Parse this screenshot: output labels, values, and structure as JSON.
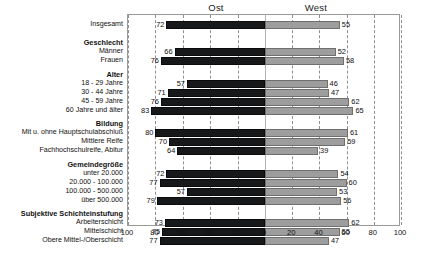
{
  "header": {
    "left_label": "Ost",
    "right_label": "West"
  },
  "axis": {
    "ticks": [
      "100",
      "80",
      "60",
      "40",
      "20",
      "0",
      "20",
      "40",
      "60",
      "80",
      "100"
    ],
    "max": 100,
    "step": 20
  },
  "colors": {
    "ost_bar": "#17181a",
    "west_bar": "#9d9d9d",
    "frame": "#9a9a9a",
    "grid": "#8f8f8f",
    "text": "#111111",
    "background": "#ffffff"
  },
  "chart_data": {
    "type": "bar",
    "title": "",
    "subtitle": "",
    "xlabel": "",
    "ylabel": "",
    "orientation": "horizontal-diverging",
    "xlim": [
      -100,
      100
    ],
    "grid": true,
    "legend_position": "top",
    "series": [
      {
        "name": "Ost",
        "side": "left",
        "color": "#17181a",
        "values": [
          72,
          66,
          76,
          57,
          71,
          76,
          83,
          80,
          70,
          64,
          72,
          77,
          57,
          79,
          73,
          75,
          77
        ]
      },
      {
        "name": "West",
        "side": "right",
        "color": "#9d9d9d",
        "values": [
          55,
          52,
          58,
          46,
          47,
          62,
          65,
          61,
          59,
          39,
          54,
          60,
          53,
          56,
          62,
          55,
          47
        ]
      }
    ],
    "categories": [
      "Insgesamt",
      "Männer",
      "Frauen",
      "18 - 29 Jahre",
      "30 - 44 Jahre",
      "45 - 59 Jahre",
      "60 Jahre und älter",
      "Mit u. ohne Hauptschulabschluß",
      "Mittlere Reife",
      "Fachhochschulreife, Abitur",
      "unter 20.000",
      "20.000 - 100.000",
      "100.000 - 500.000",
      "über 500.000",
      "Arbeiterschicht",
      "Mittelschicht",
      "Obere Mittel-/Oberschicht"
    ],
    "group_headers": [
      "Geschlecht",
      "Alter",
      "Bildung",
      "Gemeindegröße",
      "Subjektive Schichteinstufung"
    ],
    "rows": [
      {
        "kind": "group",
        "label": "",
        "ost": null,
        "west": null,
        "y": 0
      },
      {
        "kind": "data",
        "label": "Insgesamt",
        "ost": 72,
        "west": 55,
        "y": 6
      },
      {
        "kind": "group",
        "label": "Geschlecht",
        "ost": null,
        "west": null,
        "y": 25
      },
      {
        "kind": "data",
        "label": "Männer",
        "ost": 66,
        "west": 52,
        "y": 33
      },
      {
        "kind": "data",
        "label": "Frauen",
        "ost": 76,
        "west": 58,
        "y": 42
      },
      {
        "kind": "group",
        "label": "Alter",
        "ost": null,
        "west": null,
        "y": 57
      },
      {
        "kind": "data",
        "label": "18 - 29 Jahre",
        "ost": 57,
        "west": 46,
        "y": 65
      },
      {
        "kind": "data",
        "label": "30 - 44 Jahre",
        "ost": 71,
        "west": 47,
        "y": 74
      },
      {
        "kind": "data",
        "label": "45 - 59 Jahre",
        "ost": 76,
        "west": 62,
        "y": 83
      },
      {
        "kind": "data",
        "label": "60 Jahre und älter",
        "ost": 83,
        "west": 65,
        "y": 92
      },
      {
        "kind": "group",
        "label": "Bildung",
        "ost": null,
        "west": null,
        "y": 106
      },
      {
        "kind": "data",
        "label": "Mit u. ohne Hauptschulabschluß",
        "ost": 80,
        "west": 61,
        "y": 114
      },
      {
        "kind": "data",
        "label": "Mittlere Reife",
        "ost": 70,
        "west": 59,
        "y": 123
      },
      {
        "kind": "data",
        "label": "Fachhochschulreife, Abitur",
        "ost": 64,
        "west": 39,
        "y": 132
      },
      {
        "kind": "group",
        "label": "Gemeindegröße",
        "ost": null,
        "west": null,
        "y": 147
      },
      {
        "kind": "data",
        "label": "unter 20.000",
        "ost": 72,
        "west": 54,
        "y": 155
      },
      {
        "kind": "data",
        "label": "20.000 - 100.000",
        "ost": 77,
        "west": 60,
        "y": 164
      },
      {
        "kind": "data",
        "label": "100.000 - 500.000",
        "ost": 57,
        "west": 53,
        "y": 173
      },
      {
        "kind": "data",
        "label": "über 500.000",
        "ost": 79,
        "west": 56,
        "y": 182
      },
      {
        "kind": "group",
        "label": "Subjektive Schichteinstufung",
        "ost": null,
        "west": null,
        "y": 196
      },
      {
        "kind": "data",
        "label": "Arbeiterschicht",
        "ost": 73,
        "west": 62,
        "y": 204
      },
      {
        "kind": "data",
        "label": "Mittelschicht",
        "ost": 75,
        "west": 55,
        "y": 213
      },
      {
        "kind": "data",
        "label": "Obere Mittel-/Oberschicht",
        "ost": 77,
        "west": 47,
        "y": 222
      }
    ]
  }
}
